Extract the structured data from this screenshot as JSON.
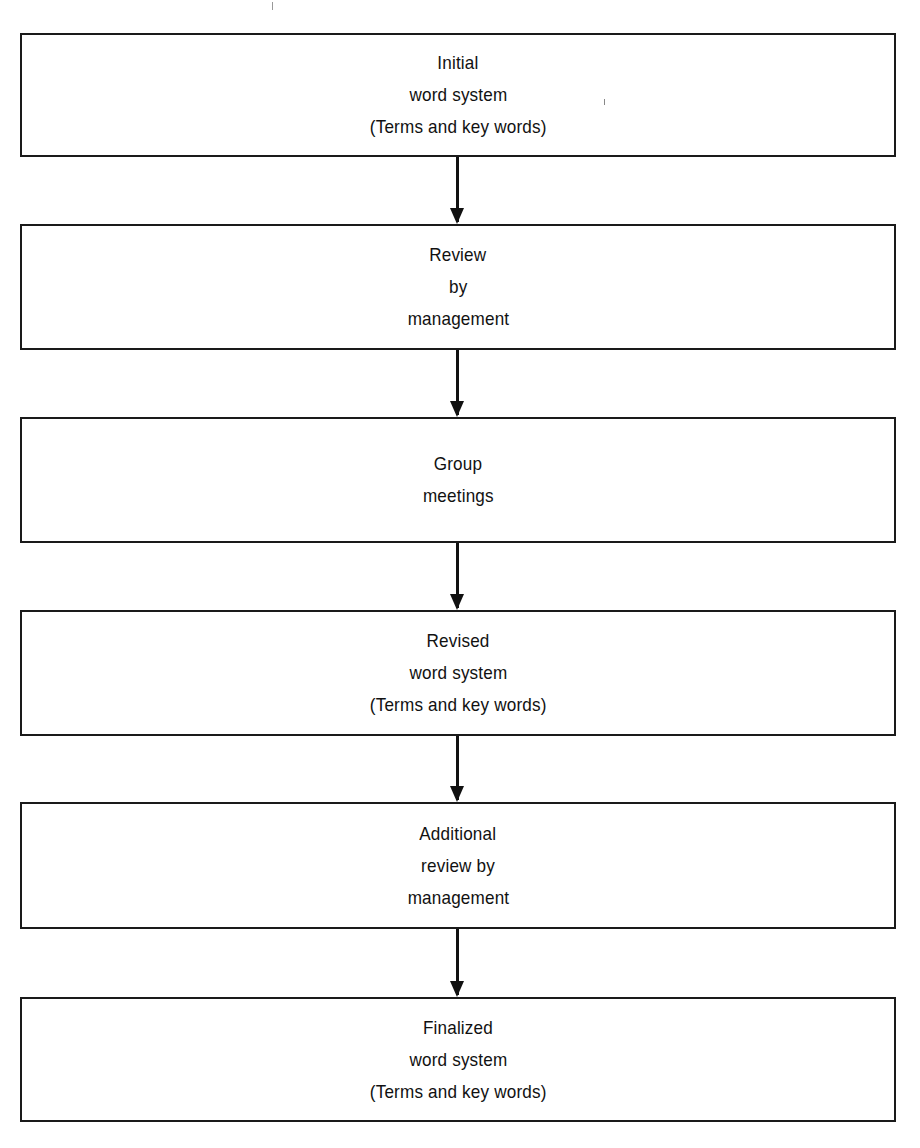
{
  "diagram": {
    "type": "flowchart",
    "direction": "top-to-bottom",
    "steps": [
      {
        "lines": [
          "Initial",
          "word system",
          "(Terms and key words)"
        ]
      },
      {
        "lines": [
          "Review",
          "by",
          "management"
        ]
      },
      {
        "lines": [
          "Group",
          "meetings"
        ]
      },
      {
        "lines": [
          "Revised",
          "word system",
          "(Terms and key words)"
        ]
      },
      {
        "lines": [
          "Additional",
          "review by",
          "management"
        ]
      },
      {
        "lines": [
          "Finalized",
          "word system",
          "(Terms and key words)"
        ]
      }
    ],
    "connectors": [
      {
        "from": 0,
        "to": 1
      },
      {
        "from": 1,
        "to": 2
      },
      {
        "from": 2,
        "to": 3
      },
      {
        "from": 3,
        "to": 4
      },
      {
        "from": 4,
        "to": 5
      }
    ]
  }
}
